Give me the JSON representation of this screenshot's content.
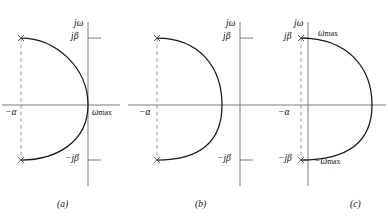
{
  "figure": {
    "type": "s-plane pole-zero / root-locus contour diagram",
    "background_color": "#ffffff",
    "axis_color": "#6b6b6b",
    "curve_color": "#1a1a1a",
    "dash_color": "#8c8c8c",
    "text_color": "#111111",
    "width": 388,
    "height": 219
  },
  "panels": [
    {
      "caption": "(a)",
      "axis_labels": {
        "imaginary_axis": "jω",
        "real_axis_negative": "−α",
        "tick_upper": "jβ",
        "tick_lower": "−jβ"
      },
      "annotations": [
        {
          "text_italic": "ω",
          "text_sub": "max",
          "position": "right of origin on real axis"
        }
      ],
      "poles": [
        {
          "marker": "x",
          "label": "jβ",
          "location": "−α + jβ"
        },
        {
          "marker": "x",
          "label": "−jβ",
          "location": "−α − jβ"
        }
      ],
      "contour": "arc bulging left, passing through the origin region, terminating at the two x poles",
      "dashed_line": "vertical dashed segment at Re = −α joining the two poles"
    },
    {
      "caption": "(b)",
      "axis_labels": {
        "imaginary_axis": "jω",
        "real_axis_negative": "−α",
        "tick_upper": "jβ",
        "tick_lower": "−jβ"
      },
      "annotations": [],
      "poles": [
        {
          "marker": "x",
          "label": "jβ",
          "location": "−α + jβ"
        },
        {
          "marker": "x",
          "label": "−jβ",
          "location": "−α − jβ"
        }
      ],
      "contour": "arc bulging right, crossing the real axis left of the imaginary axis",
      "dashed_line": "vertical dashed segment at Re = −α joining the two poles"
    },
    {
      "caption": "(c)",
      "axis_labels": {
        "imaginary_axis": "jω",
        "real_axis_negative": "−α",
        "tick_upper": "jβ",
        "tick_lower": "−jβ"
      },
      "annotations": [
        {
          "text_italic": "ω",
          "text_sub": "max",
          "position": "upper, right of jβ pole"
        },
        {
          "text_italic": "−ω",
          "text_sub": "max",
          "position": "lower, right of −jβ pole"
        }
      ],
      "poles": [
        {
          "marker": "x",
          "label": "jβ",
          "location": "just left of imaginary axis at +jβ"
        },
        {
          "marker": "x",
          "label": "−jβ",
          "location": "just left of imaginary axis at −jβ"
        }
      ],
      "contour": "arc bulging far right, crossing the real axis right of the imaginary axis",
      "dashed_line": "vertical dashed segment at Re = −α joining the two poles"
    }
  ]
}
